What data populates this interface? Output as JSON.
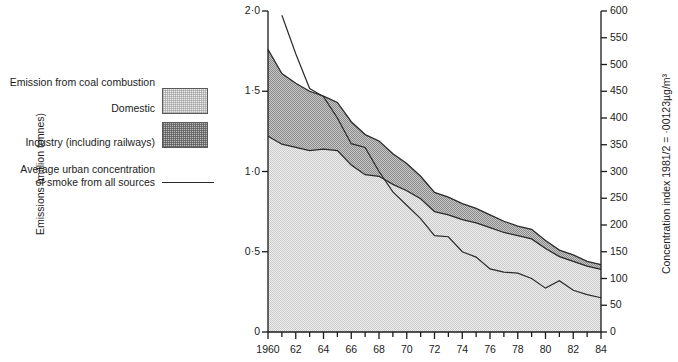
{
  "legend": {
    "title": "Emission from coal combustion",
    "domestic_label": "Domestic",
    "industry_label": "Industry (including railways)",
    "line_label_line1": "Average urban concentration",
    "line_label_line2": "of smoke from all sources",
    "domestic_swatch": "domestic-fill-swatch",
    "industry_swatch": "industry-fill-swatch",
    "line_swatch": "concentration-line-swatch"
  },
  "axes": {
    "left_title": "Emissions (million tonnes)",
    "right_title": "Concentration index 1981/2 = ·00123µg/m³",
    "left_ticks": [
      "0",
      "0·5",
      "1·0",
      "1·5",
      "2·0"
    ],
    "left_tick_values": [
      0,
      0.5,
      1.0,
      1.5,
      2.0
    ],
    "right_ticks": [
      "0",
      "50",
      "100",
      "150",
      "200",
      "250",
      "300",
      "350",
      "400",
      "450",
      "500",
      "550",
      "600"
    ],
    "right_tick_values": [
      0,
      50,
      100,
      150,
      200,
      250,
      300,
      350,
      400,
      450,
      500,
      550,
      600
    ],
    "x_ticks": [
      "1960",
      "62",
      "64",
      "66",
      "68",
      "70",
      "72",
      "74",
      "76",
      "78",
      "80",
      "82",
      "84"
    ],
    "x_tick_values": [
      1960,
      1962,
      1964,
      1966,
      1968,
      1970,
      1972,
      1974,
      1976,
      1978,
      1980,
      1982,
      1984
    ]
  },
  "colors": {
    "domestic_fill": "#ececec",
    "industry_fill": "#bdbdbd",
    "line_stroke": "#2a2a2a",
    "axis_stroke": "#1a1a1a"
  },
  "chart_data": {
    "type": "area",
    "title": "",
    "xlabel": "",
    "ylabel": "Emissions (million tonnes)",
    "y2label": "Concentration index 1981/2 = ·00123µg/m³",
    "xlim": [
      1960,
      1984
    ],
    "ylim": [
      0,
      2.0
    ],
    "y2lim": [
      0,
      600
    ],
    "grid": false,
    "legend_position": "left-outside",
    "x": [
      1960,
      1961,
      1962,
      1963,
      1964,
      1965,
      1966,
      1967,
      1968,
      1969,
      1970,
      1971,
      1972,
      1973,
      1974,
      1975,
      1976,
      1977,
      1978,
      1979,
      1980,
      1981,
      1982,
      1983,
      1984
    ],
    "series": [
      {
        "name": "Domestic",
        "type": "stacked-area",
        "unit": "million tonnes",
        "axis": "left",
        "values": [
          1.22,
          1.17,
          1.15,
          1.13,
          1.14,
          1.13,
          1.04,
          0.98,
          0.97,
          0.92,
          0.88,
          0.83,
          0.75,
          0.73,
          0.7,
          0.68,
          0.65,
          0.62,
          0.6,
          0.58,
          0.52,
          0.47,
          0.44,
          0.41,
          0.39
        ]
      },
      {
        "name": "Industry (including railways)",
        "type": "stacked-area",
        "unit": "million tonnes",
        "axis": "left",
        "values": [
          0.54,
          0.44,
          0.4,
          0.37,
          0.33,
          0.3,
          0.27,
          0.25,
          0.22,
          0.19,
          0.17,
          0.14,
          0.12,
          0.11,
          0.1,
          0.09,
          0.08,
          0.07,
          0.06,
          0.06,
          0.05,
          0.04,
          0.04,
          0.03,
          0.03
        ]
      },
      {
        "name": "Average urban concentration of smoke from all sources",
        "type": "line",
        "unit": "index",
        "axis": "right",
        "values": [
          null,
          592,
          520,
          455,
          440,
          400,
          352,
          345,
          300,
          262,
          237,
          212,
          180,
          178,
          150,
          140,
          118,
          112,
          110,
          100,
          82,
          96,
          78,
          70,
          64
        ]
      }
    ],
    "totals": {
      "name": "Total emissions (domestic + industry)",
      "values": [
        1.76,
        1.61,
        1.55,
        1.5,
        1.47,
        1.43,
        1.31,
        1.23,
        1.19,
        1.11,
        1.05,
        0.97,
        0.87,
        0.84,
        0.8,
        0.77,
        0.73,
        0.69,
        0.66,
        0.64,
        0.57,
        0.51,
        0.48,
        0.44,
        0.42
      ]
    }
  }
}
